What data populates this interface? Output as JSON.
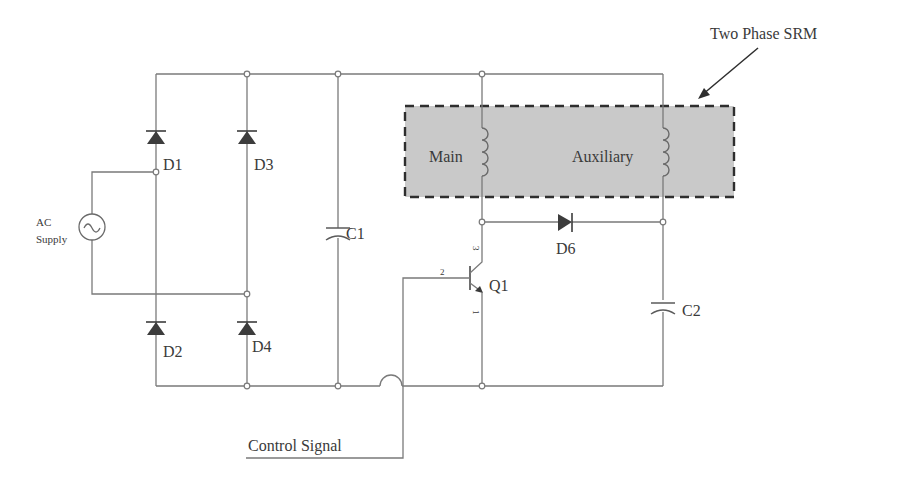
{
  "diagram": {
    "title": "Two Phase SRM",
    "srm_box": {
      "fill": "#c8c8c8",
      "border": "#333333"
    },
    "labels": {
      "ac_supply_line1": "AC",
      "ac_supply_line2": "Supply",
      "d1": "D1",
      "d2": "D2",
      "d3": "D3",
      "d4": "D4",
      "d6": "D6",
      "c1": "C1",
      "c2": "C2",
      "q1": "Q1",
      "q1_pin_base": "2",
      "q1_pin_collector": "3",
      "q1_pin_emitter": "1",
      "main_winding": "Main",
      "aux_winding": "Auxiliary",
      "control_signal": "Control Signal"
    },
    "components": [
      {
        "id": "AC",
        "type": "ac-source",
        "label": "AC Supply"
      },
      {
        "id": "D1",
        "type": "diode"
      },
      {
        "id": "D2",
        "type": "diode"
      },
      {
        "id": "D3",
        "type": "diode"
      },
      {
        "id": "D4",
        "type": "diode"
      },
      {
        "id": "C1",
        "type": "capacitor"
      },
      {
        "id": "Main",
        "type": "inductor",
        "group": "Two Phase SRM"
      },
      {
        "id": "Auxiliary",
        "type": "inductor",
        "group": "Two Phase SRM"
      },
      {
        "id": "D6",
        "type": "diode"
      },
      {
        "id": "Q1",
        "type": "npn-transistor",
        "pins": [
          "1",
          "2",
          "3"
        ]
      },
      {
        "id": "C2",
        "type": "capacitor"
      }
    ]
  }
}
